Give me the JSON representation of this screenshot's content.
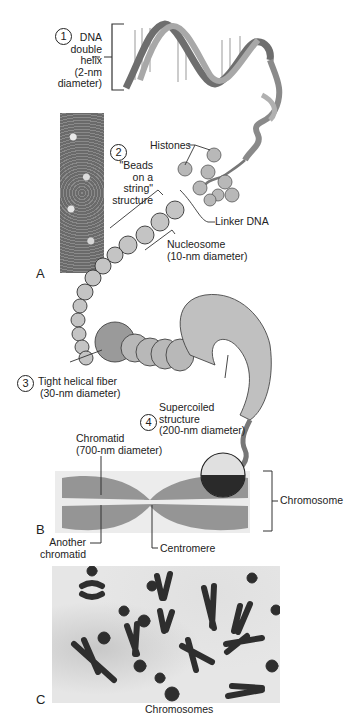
{
  "figure": {
    "panels": [
      "A",
      "B",
      "C"
    ],
    "levels": [
      {
        "number": "1",
        "label_lines": [
          "DNA",
          "double",
          "helix",
          "(2-nm",
          "diameter)"
        ]
      },
      {
        "number": "2",
        "label_lines": [
          "\"Beads",
          "on a",
          "string\"",
          "structure"
        ]
      },
      {
        "number": "3",
        "label_lines": [
          "Tight helical fiber",
          "(30-nm diameter)"
        ]
      },
      {
        "number": "4",
        "label_lines": [
          "Supercoiled",
          "structure",
          "(200-nm diameter)"
        ]
      }
    ],
    "callouts": {
      "histones": "Histones",
      "linker_dna": "Linker DNA",
      "nucleosome": [
        "Nucleosome",
        "(10-nm diameter)"
      ],
      "chromatid": [
        "Chromatid",
        "(700-nm diameter)"
      ],
      "another_chromatid": [
        "Another",
        "chromatid"
      ],
      "centromere": "Centromere",
      "chromosome": "Chromosome",
      "caption_c": "Chromosomes"
    },
    "colors": {
      "helix_dark": "#6e6e6e",
      "helix_light": "#a8a8a8",
      "bead_fill": "#b8b8b8",
      "outline": "#333333",
      "chromatin_dots": "#8c8c8c",
      "chromosome_dark": "#2e2e2e"
    }
  }
}
